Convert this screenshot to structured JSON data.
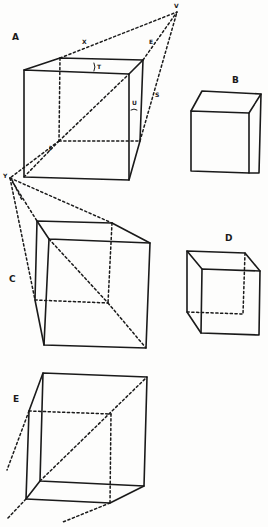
{
  "figure": {
    "colors": {
      "ink": "#1a1a1a",
      "paper": "#fdfdfc"
    }
  },
  "labels": {
    "cube_a": "A",
    "cube_b": "B",
    "cube_c": "C",
    "cube_d": "D",
    "cube_e": "E",
    "vanishing_v": "V",
    "vanishing_y": "Y",
    "mark_x": "X",
    "mark_e": "E",
    "mark_t": "T",
    "mark_u": "U",
    "mark_s": "S",
    "mark_j": "J",
    "mark_y2": "Y"
  }
}
